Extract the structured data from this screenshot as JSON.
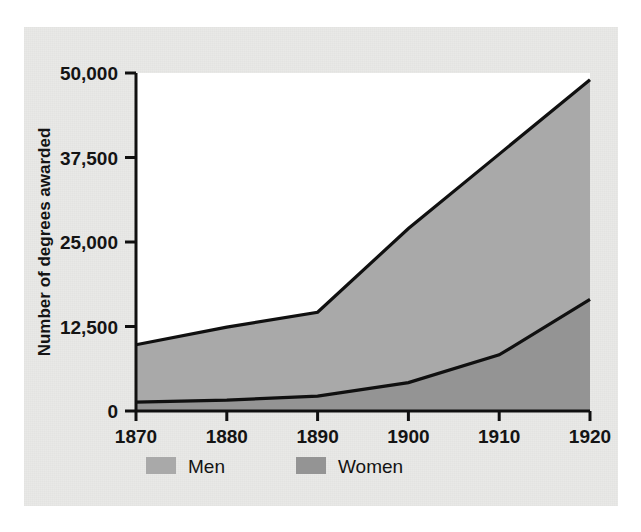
{
  "chart_data": {
    "type": "area",
    "title": "",
    "subtitle": "",
    "xlabel": "",
    "ylabel": "Number of degrees awarded",
    "stacked": true,
    "grid": false,
    "legend_position": "bottom-left",
    "x": [
      1870,
      1880,
      1890,
      1900,
      1910,
      1920
    ],
    "xtick_labels": [
      "1870",
      "1880",
      "1890",
      "1900",
      "1910",
      "1920"
    ],
    "ytick_labels": [
      "0",
      "12,500",
      "25,000",
      "37,500",
      "50,000"
    ],
    "ytick_values": [
      0,
      12500,
      25000,
      37500,
      50000
    ],
    "xlim": [
      1870,
      1920
    ],
    "ylim": [
      0,
      50000
    ],
    "series": [
      {
        "name": "Women",
        "color": "#949494",
        "stack_order": 1,
        "values": [
          1300,
          1600,
          2200,
          4200,
          8300,
          16500
        ]
      },
      {
        "name": "Men",
        "color": "#a9a9a9",
        "stack_order": 2,
        "values": [
          8500,
          10800,
          12400,
          22800,
          29700,
          32500
        ]
      }
    ],
    "cumulative_totals": [
      9800,
      12400,
      14600,
      27000,
      38000,
      49000
    ],
    "legend": [
      {
        "label": "Men",
        "color": "#a9a9a9"
      },
      {
        "label": "Women",
        "color": "#949494"
      }
    ]
  },
  "figure": {
    "panel_background": "#e9e9e7",
    "plot_background": "#ffffff",
    "line_color": "#101010",
    "text_color": "#141414"
  }
}
